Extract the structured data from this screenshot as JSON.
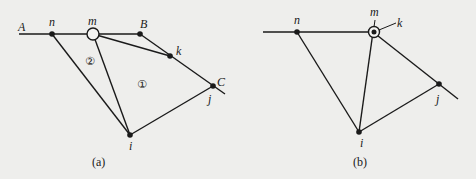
{
  "figure_a": {
    "caption": "(a)",
    "labels": {
      "A": "A",
      "B": "B",
      "C": "C",
      "n": "n",
      "m": "m",
      "k": "k",
      "j": "j",
      "i": "i"
    },
    "regions": {
      "r1": "①",
      "r2": "②"
    }
  },
  "figure_b": {
    "caption": "(b)",
    "labels": {
      "n": "n",
      "m": "m",
      "k": "k",
      "j": "j",
      "i": "i"
    }
  },
  "colors": {
    "background": "#eeeeec",
    "stroke": "#1a1a1a"
  }
}
